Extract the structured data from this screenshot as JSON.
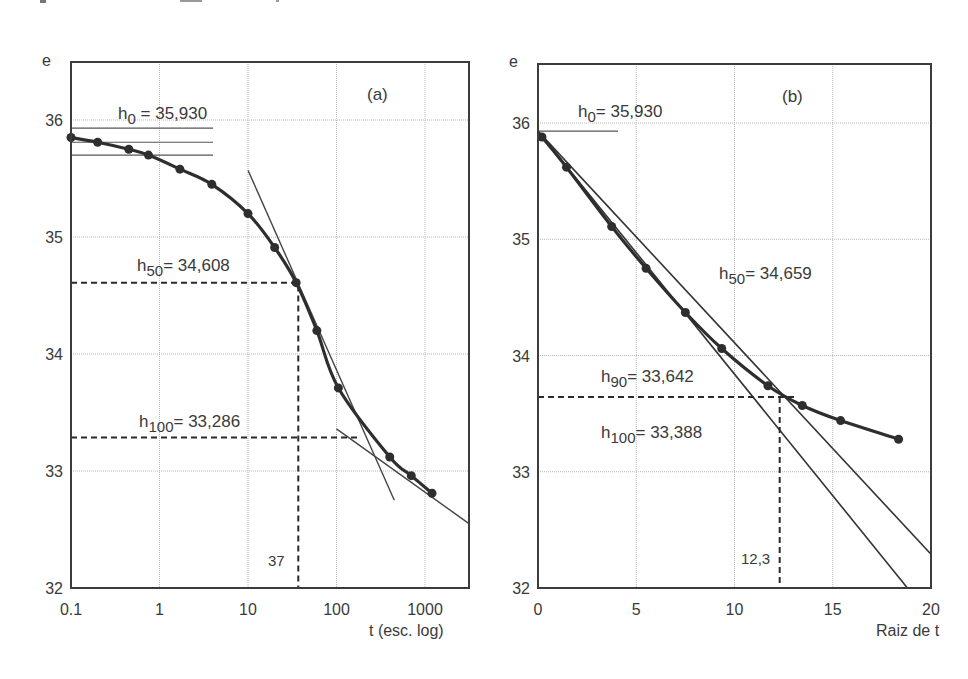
{
  "figure": {
    "top_caption_cropped": true
  },
  "chart_data": [
    {
      "id": "a",
      "type": "line",
      "panel_label": "(a)",
      "title": "",
      "xlabel": "t (esc. log)",
      "ylabel": "e",
      "xscale": "log",
      "xlim": [
        0.1,
        3000
      ],
      "ylim": [
        32,
        36.2
      ],
      "x_ticks": [
        "0.1",
        "1",
        "10",
        "100",
        "1000"
      ],
      "x_tick_values": [
        0.1,
        1,
        10,
        100,
        1000
      ],
      "y_ticks": [
        "32",
        "33",
        "34",
        "35",
        "36"
      ],
      "y_tick_values": [
        32,
        33,
        34,
        35,
        36
      ],
      "grid": true,
      "series": [
        {
          "name": "e vs t",
          "x": [
            0.1,
            0.2,
            0.45,
            0.75,
            1.7,
            3.9,
            10,
            20,
            35,
            60,
            105,
            400,
            700,
            1200
          ],
          "y": [
            35.85,
            35.81,
            35.75,
            35.7,
            35.58,
            35.45,
            35.2,
            34.91,
            34.61,
            34.2,
            33.71,
            33.12,
            32.96,
            32.81
          ]
        }
      ],
      "annotations": [
        {
          "label": "h",
          "sub": "0",
          "text": " = 35,930",
          "value": 35.93
        },
        {
          "label": "h",
          "sub": "50",
          "text": "= 34,608",
          "value": 34.608
        },
        {
          "label": "h",
          "sub": "100",
          "text": "= 33,286",
          "value": 33.286
        },
        {
          "label": "37",
          "value": 37,
          "note": "t50 read from x axis"
        }
      ],
      "constructions": {
        "h0_lines_y": [
          35.93,
          35.81,
          35.7
        ],
        "tangent_inflection": [
          [
            10,
            35.57
          ],
          [
            450,
            32.75
          ]
        ],
        "tangent_tail": [
          [
            100,
            33.36
          ],
          [
            3000,
            32.55
          ]
        ]
      }
    },
    {
      "id": "b",
      "type": "line",
      "panel_label": "(b)",
      "title": "",
      "xlabel": "Raiz de t",
      "ylabel": "e",
      "xscale": "linear",
      "xlim": [
        0,
        20
      ],
      "ylim": [
        32,
        36.2
      ],
      "x_ticks": [
        "0",
        "5",
        "10",
        "15",
        "20"
      ],
      "x_tick_values": [
        0,
        5,
        10,
        15,
        20
      ],
      "y_ticks": [
        "32",
        "33",
        "34",
        "35",
        "36"
      ],
      "y_tick_values": [
        32,
        33,
        34,
        35,
        36
      ],
      "grid": true,
      "series": [
        {
          "name": "e vs raiz de t",
          "x": [
            0.2,
            1.45,
            3.75,
            5.5,
            7.5,
            9.35,
            11.7,
            13.45,
            15.4,
            18.35
          ],
          "y": [
            35.88,
            35.62,
            35.11,
            34.75,
            34.37,
            34.06,
            33.74,
            33.57,
            33.44,
            33.28
          ]
        }
      ],
      "annotations": [
        {
          "label": "h",
          "sub": "0",
          "text": "= 35,930",
          "value": 35.93
        },
        {
          "label": "h",
          "sub": "50",
          "text": "= 34,659",
          "value": 34.659
        },
        {
          "label": "h",
          "sub": "90",
          "text": "= 33,642",
          "value": 33.642
        },
        {
          "label": "h",
          "sub": "100",
          "text": "= 33,388",
          "value": 33.388
        },
        {
          "label": "12,3",
          "value": 12.3,
          "note": "raiz t90 read from x axis"
        }
      ],
      "constructions": {
        "tangent_initial": [
          [
            0,
            35.93
          ],
          [
            18.8,
            32.0
          ]
        ],
        "tangent_1_15": [
          [
            0,
            35.93
          ],
          [
            20,
            32.29
          ]
        ]
      }
    }
  ],
  "labels": {
    "a": {
      "ylabel": "e",
      "panel": "(a)",
      "xlabel": "t (esc. log)",
      "h0_main": "h",
      "h0_sub": "0",
      "h0_val": " = 35,930",
      "h50_main": "h",
      "h50_sub": "50",
      "h50_val": "= 34,608",
      "h100_main": "h",
      "h100_sub": "100",
      "h100_val": "= 33,286",
      "t50": "37"
    },
    "b": {
      "ylabel": "e",
      "panel": "(b)",
      "xlabel": "Raiz de t",
      "h0_main": "h",
      "h0_sub": "0",
      "h0_val": "= 35,930",
      "h50_main": "h",
      "h50_sub": "50",
      "h50_val": "= 34,659",
      "h90_main": "h",
      "h90_sub": "90",
      "h90_val": "= 33,642",
      "h100_main": "h",
      "h100_sub": "100",
      "h100_val": "= 33,388",
      "t90": "12,3"
    }
  },
  "colors": {
    "axis": "#3c3c3c",
    "grid": "#b8b8b8",
    "curve": "#2e2e2e",
    "text": "#3a3a3a"
  }
}
